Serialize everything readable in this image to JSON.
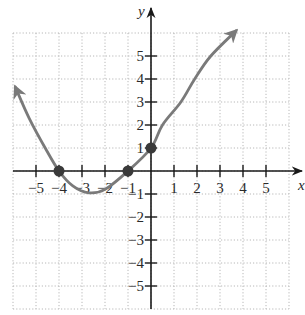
{
  "chart_data": {
    "type": "line",
    "title": "",
    "xlabel": "x",
    "ylabel": "y",
    "xlim": [
      -6,
      6
    ],
    "ylim": [
      -6,
      6
    ],
    "grid": true,
    "x_ticks": [
      -5,
      -4,
      -3,
      -2,
      -1,
      1,
      2,
      3,
      4,
      5
    ],
    "y_ticks": [
      -5,
      -4,
      -3,
      -2,
      -1,
      1,
      2,
      3,
      4,
      5
    ],
    "x_tick_labels": [
      "−5",
      "−4",
      "−3",
      "−2",
      "−1",
      "1",
      "2",
      "3",
      "4",
      "5"
    ],
    "y_tick_labels": [
      "−5",
      "−4",
      "−3",
      "−2",
      "−1",
      "1",
      "2",
      "3",
      "4",
      "5"
    ],
    "series": [
      {
        "name": "curve",
        "color": "#7a7a7a",
        "arrows_both_ends": true,
        "x": [
          -5.9,
          -5.3,
          -4.6,
          -4.0,
          -3.4,
          -2.7,
          -2.0,
          -1.0,
          0.0,
          0.5,
          1.3,
          1.9,
          2.6,
          3.7
        ],
        "y": [
          3.65,
          2.3,
          1.0,
          0.0,
          -0.65,
          -0.95,
          -0.8,
          0.0,
          1.0,
          2.0,
          3.0,
          4.0,
          5.0,
          6.1
        ]
      }
    ],
    "highlighted_points": [
      {
        "x": -4,
        "y": 0
      },
      {
        "x": -1,
        "y": 0
      },
      {
        "x": 0,
        "y": 1
      }
    ]
  },
  "axes": {
    "x_label": "x",
    "y_label": "y"
  }
}
